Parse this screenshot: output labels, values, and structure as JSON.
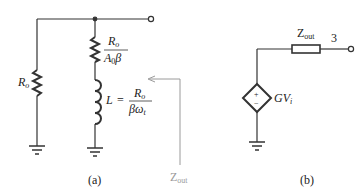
{
  "figure_a": {
    "caption": "(a)",
    "left_resistor": {
      "symbol": "R",
      "subscript": "o"
    },
    "series_resistor": {
      "numerator": "R",
      "numerator_sub": "o",
      "denominator": "A",
      "denominator_sub": "0",
      "denominator_tail": "β"
    },
    "inductor": {
      "lhs": "L",
      "equals": "=",
      "numerator": "R",
      "numerator_sub": "o",
      "denominator": "βω",
      "denominator_sub": "t"
    },
    "output_impedance_arrow": {
      "symbol": "Z",
      "subscript": "out",
      "color": "#9a9a9a"
    }
  },
  "figure_b": {
    "caption": "(b)",
    "output_impedance": {
      "symbol": "Z",
      "subscript": "out"
    },
    "terminal_label": "3",
    "dependent_source": {
      "plus": "+",
      "minus": "−",
      "gain": "GV",
      "gain_sub": "i"
    }
  },
  "colors": {
    "wire": "#333333",
    "arrow": "#9a9a9a",
    "background": "#ffffff"
  }
}
